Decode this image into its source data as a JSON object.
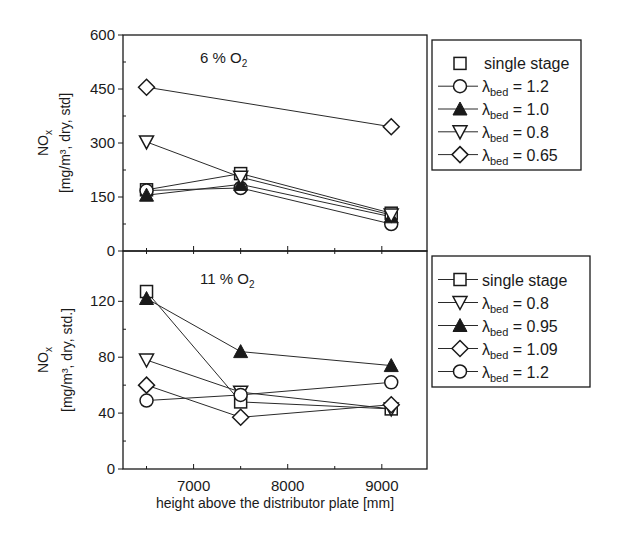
{
  "chart_data": [
    {
      "type": "line",
      "panel": "top",
      "annotation": "6 % O2",
      "annotation_main": "6 % O",
      "annotation_sub": "2",
      "xlabel": "",
      "ylabel_line1": "NOx",
      "ylabel_line2": "[mg/m³, dry, std]",
      "ylim": [
        0,
        600
      ],
      "yticks": [
        0,
        150,
        300,
        450,
        600
      ],
      "xlim": [
        6250,
        9480
      ],
      "x": [
        6500,
        7500,
        9100
      ],
      "grid": false,
      "legend_position": "right",
      "series": [
        {
          "name": "single stage",
          "label_main": "single stage",
          "label_sub": "",
          "marker": "square",
          "filled": false,
          "line_in_legend": false,
          "values": [
            170,
            215,
            105
          ]
        },
        {
          "name": "λbed = 1.2",
          "label_main": "λ",
          "label_sub": "bed",
          "label_rest": " = 1.2",
          "marker": "circle",
          "filled": false,
          "line_in_legend": true,
          "values": [
            168,
            175,
            75
          ]
        },
        {
          "name": "λbed = 1.0",
          "label_main": "λ",
          "label_sub": "bed",
          "label_rest": " = 1.0",
          "marker": "triangle-up",
          "filled": true,
          "line_in_legend": true,
          "values": [
            155,
            185,
            95
          ]
        },
        {
          "name": "λbed = 0.8",
          "label_main": "λ",
          "label_sub": "bed",
          "label_rest": " = 0.8",
          "marker": "triangle-down",
          "filled": false,
          "line_in_legend": true,
          "values": [
            303,
            205,
            100
          ]
        },
        {
          "name": "λbed = 0.65",
          "label_main": "λ",
          "label_sub": "bed",
          "label_rest": " = 0.65",
          "marker": "diamond",
          "filled": false,
          "line_in_legend": true,
          "values": [
            455,
            null,
            345
          ]
        }
      ]
    },
    {
      "type": "line",
      "panel": "bottom",
      "annotation": "11 % O2",
      "annotation_main": "11 % O",
      "annotation_sub": "2",
      "xlabel": "height above the distributor plate [mm]",
      "ylabel_line1": "NOx",
      "ylabel_line2": "[mg/m³, dry, std.]",
      "ylim": [
        0,
        156
      ],
      "yticks": [
        0,
        40,
        80,
        120
      ],
      "xlim": [
        6250,
        9480
      ],
      "xticks": [
        7000,
        8000,
        9000
      ],
      "x": [
        6500,
        7500,
        9100
      ],
      "grid": false,
      "legend_position": "right",
      "series": [
        {
          "name": "single stage",
          "label_main": "single stage",
          "label_sub": "",
          "marker": "square",
          "filled": false,
          "line_in_legend": true,
          "values": [
            127,
            48,
            43
          ]
        },
        {
          "name": "λbed = 0.8",
          "label_main": "λ",
          "label_sub": "bed",
          "label_rest": " = 0.8",
          "marker": "triangle-down",
          "filled": false,
          "line_in_legend": true,
          "values": [
            78,
            55,
            43
          ]
        },
        {
          "name": "λbed = 0.95",
          "label_main": "λ",
          "label_sub": "bed",
          "label_rest": " = 0.95",
          "marker": "triangle-up",
          "filled": true,
          "line_in_legend": true,
          "values": [
            122,
            84,
            74
          ]
        },
        {
          "name": "λbed = 1.09",
          "label_main": "λ",
          "label_sub": "bed",
          "label_rest": " = 1.09",
          "marker": "diamond",
          "filled": false,
          "line_in_legend": true,
          "values": [
            60,
            37,
            46
          ]
        },
        {
          "name": "λbed = 1.2",
          "label_main": "λ",
          "label_sub": "bed",
          "label_rest": " = 1.2",
          "marker": "circle",
          "filled": false,
          "line_in_legend": true,
          "values": [
            49,
            53,
            62
          ]
        }
      ]
    }
  ],
  "colors": {
    "ink": "#1a1a1a",
    "background": "#ffffff"
  }
}
